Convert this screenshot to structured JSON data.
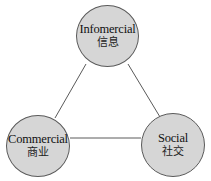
{
  "diagram": {
    "type": "triangle-network",
    "colors": {
      "node_fill": "#d6d6d6",
      "node_border": "#5a5a5a",
      "edge": "#5a5a5a",
      "background": "#ffffff"
    },
    "nodes": [
      {
        "id": "infomercial",
        "label_en": "Infomercial",
        "label_zh": "信息"
      },
      {
        "id": "commercial",
        "label_en": "Commercial",
        "label_zh": "商业"
      },
      {
        "id": "social",
        "label_en": "Social",
        "label_zh": "社交"
      }
    ],
    "edges": [
      {
        "from": "infomercial",
        "to": "commercial"
      },
      {
        "from": "infomercial",
        "to": "social"
      },
      {
        "from": "commercial",
        "to": "social"
      }
    ]
  }
}
